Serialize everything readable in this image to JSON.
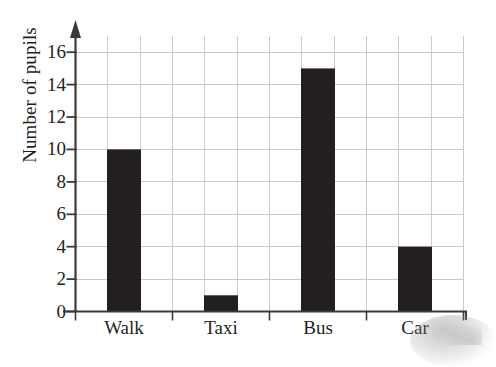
{
  "chart_data": {
    "type": "bar",
    "title": "",
    "xlabel": "",
    "ylabel": "Number of pupils",
    "categories": [
      "Walk",
      "Taxi",
      "Bus",
      "Car"
    ],
    "values": [
      10,
      1,
      15,
      4
    ],
    "ylim": [
      0,
      17
    ],
    "ytick_values": [
      0,
      2,
      4,
      6,
      8,
      10,
      12,
      14,
      16
    ],
    "ytick_labels": [
      "0",
      "2",
      "4",
      "6",
      "8",
      "10",
      "12",
      "14",
      "16"
    ],
    "grid": "both",
    "legend": "none",
    "bar_color": "#231f20",
    "grid_color": "#c9c9c9",
    "axis_color": "#3a3a3a",
    "background": "#ffffff",
    "y_axis_has_arrow": true,
    "annotations": []
  },
  "axis": {
    "y_title": "Number of pupils"
  },
  "bars": [
    {
      "label": "Walk",
      "value": 10,
      "value_text": "10"
    },
    {
      "label": "Taxi",
      "value": 1,
      "value_text": "1"
    },
    {
      "label": "Bus",
      "value": 15,
      "value_text": "15"
    },
    {
      "label": "Car",
      "value": 4,
      "value_text": "4"
    }
  ],
  "yticks": [
    {
      "label": "16",
      "value": 16
    },
    {
      "label": "14",
      "value": 14
    },
    {
      "label": "12",
      "value": 12
    },
    {
      "label": "10",
      "value": 10
    },
    {
      "label": "8",
      "value": 8
    },
    {
      "label": "6",
      "value": 6
    },
    {
      "label": "4",
      "value": 4
    },
    {
      "label": "2",
      "value": 2
    },
    {
      "label": "0",
      "value": 0
    }
  ]
}
